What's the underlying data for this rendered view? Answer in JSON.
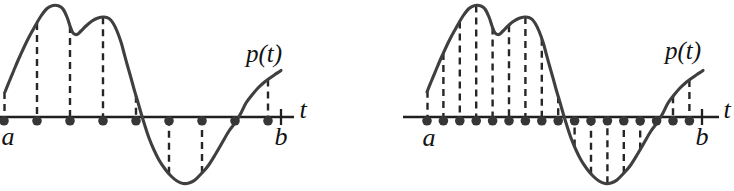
{
  "canvas": {
    "width": 734,
    "height": 191,
    "background": "#ffffff"
  },
  "style": {
    "curve_color": "#3f3f3f",
    "axis_color": "#1f1f1f",
    "dash_color": "#262626",
    "dot_color": "#363636",
    "label_color": "#121212",
    "curve_width": 3.1,
    "axis_width": 2.3,
    "dash_width": 2.4,
    "tick_width": 2.3,
    "dot_radius": 4.8,
    "dot_offset_below_axis": 3.8,
    "tick_half_height": 8,
    "dash_pattern": "7 5",
    "label_font_size": 26,
    "curve_label_font_size": 25
  },
  "curve_shape": [
    [
      0,
      92
    ],
    [
      4,
      82
    ],
    [
      9,
      70
    ],
    [
      15,
      56
    ],
    [
      22,
      41
    ],
    [
      29,
      28
    ],
    [
      36,
      16
    ],
    [
      42,
      8.5
    ],
    [
      48,
      5.5
    ],
    [
      54,
      6
    ],
    [
      58,
      9
    ],
    [
      62,
      17
    ],
    [
      65,
      26
    ],
    [
      68,
      33
    ],
    [
      72,
      34.5
    ],
    [
      76,
      31
    ],
    [
      81,
      26
    ],
    [
      87,
      21
    ],
    [
      93,
      18
    ],
    [
      99,
      17
    ],
    [
      104,
      18.5
    ],
    [
      108,
      23
    ],
    [
      112,
      31
    ],
    [
      116,
      42
    ],
    [
      119,
      53
    ],
    [
      122,
      64
    ],
    [
      126,
      78
    ],
    [
      129,
      89
    ],
    [
      132,
      99
    ],
    [
      136,
      113
    ],
    [
      140,
      126
    ],
    [
      144,
      138
    ],
    [
      149,
      150
    ],
    [
      154,
      160
    ],
    [
      160,
      169
    ],
    [
      166,
      176
    ],
    [
      172,
      181
    ],
    [
      178,
      183.5
    ],
    [
      184,
      183
    ],
    [
      190,
      180
    ],
    [
      196,
      174
    ],
    [
      203,
      166
    ],
    [
      210,
      155
    ],
    [
      217,
      143
    ],
    [
      224,
      131
    ],
    [
      230,
      123
    ],
    [
      236,
      113
    ],
    [
      241,
      103
    ],
    [
      247,
      95
    ],
    [
      253,
      88
    ],
    [
      259,
      82.5
    ],
    [
      265,
      78
    ],
    [
      270,
      74.5
    ],
    [
      276,
      70.5
    ]
  ],
  "chart_data": [
    {
      "type": "line",
      "name": "coarse-sampling-panel",
      "curve_label": "p(t)",
      "axis_label": "t",
      "interval_start_label": "a",
      "interval_end_label": "b",
      "num_sample_points": 9,
      "axis_y": 117,
      "axis_x1": 0,
      "axis_x2": 294,
      "end_tick_x": 281,
      "curve_origin_x": 5,
      "sample_dots_x": [
        4,
        37,
        70,
        103,
        136,
        169,
        202,
        235,
        268
      ],
      "dash_xs": [
        4.5,
        37,
        70,
        103,
        136,
        169,
        202,
        268
      ],
      "label_positions": {
        "a": [
          8,
          145
        ],
        "b": [
          281,
          145
        ],
        "t": [
          303,
          118
        ],
        "p": [
          264,
          62
        ]
      }
    },
    {
      "type": "line",
      "name": "fine-sampling-panel",
      "curve_label": "p(t)",
      "axis_label": "t",
      "interval_start_label": "a",
      "interval_end_label": "b",
      "num_sample_points": 17,
      "axis_y": 117,
      "axis_x1": 403,
      "axis_x2": 719,
      "end_tick_x": 702,
      "curve_origin_x": 427,
      "sample_dots_x": [
        427,
        443.4,
        459.8,
        476.2,
        492.6,
        509,
        525.4,
        541.8,
        558.2,
        574.6,
        591,
        607.4,
        623.8,
        640.2,
        656.6,
        673,
        689.4
      ],
      "dash_xs": [
        427.5,
        443.4,
        459.8,
        476.2,
        492.6,
        509,
        525.4,
        541.8,
        558.2,
        574.6,
        591,
        607.4,
        623.8,
        640.2,
        673,
        689.4
      ],
      "label_positions": {
        "a": [
          429,
          146
        ],
        "b": [
          702,
          145
        ],
        "t": [
          727,
          118
        ],
        "p": [
          683,
          59
        ]
      }
    }
  ]
}
